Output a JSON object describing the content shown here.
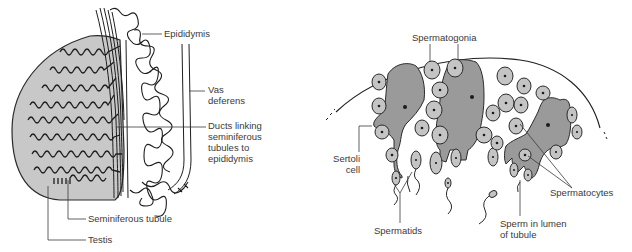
{
  "left_panel": {
    "title": "Testis and epididymis",
    "labels": {
      "epididymis": "Epididymis",
      "vas_deferens": "Vas\ndeferens",
      "ducts": "Ducts linking\nseminiferous\ntubules to\nepididymis",
      "seminiferous_tubule": "Seminiferous tubule",
      "testis": "Testis"
    }
  },
  "right_panel": {
    "title": "Section of seminiferous tubule",
    "labels": {
      "spermatogonia": "Spermatogonia",
      "sertoli_cell": "Sertoli\ncell",
      "spermatocytes": "Spermatocytes",
      "spermatids": "Spermatids",
      "sperm_in_lumen": "Sperm in lumen\nof tubule"
    }
  },
  "colors": {
    "testis_fill": "#c8c8c8",
    "sertoli_fill": "#9a9a9a",
    "germ_cell_fill": "#c4c4c4",
    "line": "#2a2a2a",
    "label_text": "#3a3a3a"
  }
}
